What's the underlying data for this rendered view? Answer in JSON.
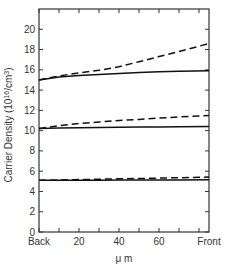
{
  "chart_data": {
    "type": "line",
    "title": "",
    "xlabel": "μ m",
    "ylabel": "Carrier Density (10^16/cm^3)",
    "ylabel_parts": {
      "main": "Carrier Density (10",
      "sup1": "16",
      "mid": "/cm",
      "sup2": "3",
      "end": ")"
    },
    "xlim": [
      0,
      85
    ],
    "ylim": [
      0,
      22
    ],
    "x_ticks": [
      0,
      10,
      20,
      30,
      40,
      50,
      60,
      70,
      80
    ],
    "x_tick_labels": [
      {
        "x": 0,
        "label": "Back"
      },
      {
        "x": 20,
        "label": "20"
      },
      {
        "x": 40,
        "label": "40"
      },
      {
        "x": 60,
        "label": "60"
      },
      {
        "x": 85,
        "label": "Front"
      }
    ],
    "y_ticks": [
      0,
      2,
      4,
      6,
      8,
      10,
      12,
      14,
      16,
      18,
      20
    ],
    "y_tick_labels": [
      "0",
      "2",
      "4",
      "6",
      "8",
      "10",
      "12",
      "14",
      "16",
      "18",
      "20"
    ],
    "grid": false,
    "legend": null,
    "x": [
      0,
      10,
      20,
      30,
      40,
      50,
      60,
      70,
      85
    ],
    "series": [
      {
        "name": "high-solid",
        "style": "solid",
        "values": [
          15.0,
          15.3,
          15.45,
          15.55,
          15.65,
          15.75,
          15.8,
          15.85,
          15.9
        ]
      },
      {
        "name": "high-dashed",
        "style": "dashed",
        "values": [
          15.0,
          15.4,
          15.7,
          15.95,
          16.3,
          16.8,
          17.3,
          17.8,
          18.6
        ]
      },
      {
        "name": "mid-solid",
        "style": "solid",
        "values": [
          10.2,
          10.25,
          10.28,
          10.3,
          10.33,
          10.35,
          10.37,
          10.39,
          10.4
        ]
      },
      {
        "name": "mid-dashed",
        "style": "dashed",
        "values": [
          10.2,
          10.5,
          10.7,
          10.85,
          11.0,
          11.1,
          11.25,
          11.35,
          11.5
        ]
      },
      {
        "name": "low-solid",
        "style": "solid",
        "values": [
          5.1,
          5.1,
          5.1,
          5.11,
          5.12,
          5.12,
          5.13,
          5.14,
          5.15
        ]
      },
      {
        "name": "low-dashed",
        "style": "dashed",
        "values": [
          5.1,
          5.13,
          5.17,
          5.21,
          5.25,
          5.28,
          5.32,
          5.36,
          5.42
        ]
      }
    ]
  },
  "colors": {
    "line": "#111111",
    "axis": "#333333",
    "background": "#ffffff"
  }
}
